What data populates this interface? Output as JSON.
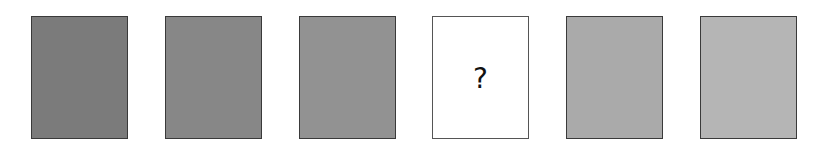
{
  "puzzle": {
    "cards": [
      {
        "index": 1,
        "fill": "#7b7b7b",
        "known": true
      },
      {
        "index": 2,
        "fill": "#878787",
        "known": true
      },
      {
        "index": 3,
        "fill": "#929292",
        "known": true
      },
      {
        "index": 4,
        "fill": "#ffffff",
        "known": false,
        "label": "?"
      },
      {
        "index": 5,
        "fill": "#aaaaaa",
        "known": true
      },
      {
        "index": 6,
        "fill": "#b5b5b5",
        "known": true
      }
    ],
    "missing_label": "?"
  }
}
